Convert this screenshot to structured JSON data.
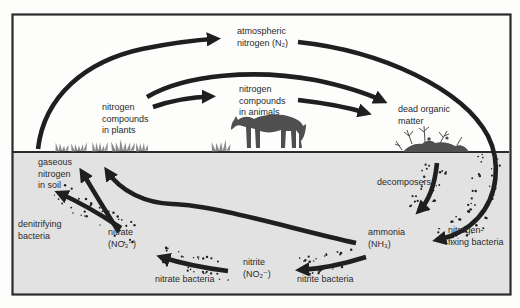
{
  "diagram": {
    "type": "cycle-diagram",
    "colors": {
      "background": "#fdfdfc",
      "soil": "#e2e2e2",
      "arrow": "#1f1f1f",
      "text": "#2a2a2a",
      "frame": "#2b2b2b",
      "silhouette": "#4f4f4f",
      "vegetation": "#8b8b8b"
    },
    "nodes": {
      "atmospheric_nitrogen": {
        "lines": [
          "atmospheric",
          "nitrogen (N₂)"
        ]
      },
      "nitrogen_compounds_in_plants": {
        "lines": [
          "nitrogen",
          "compounds",
          "in plants"
        ]
      },
      "nitrogen_compounds_in_animals": {
        "lines": [
          "nitrogen",
          "compounds",
          "in animals"
        ]
      },
      "dead_organic_matter": {
        "lines": [
          "dead organic",
          "matter"
        ]
      },
      "gaseous_nitrogen_in_soil": {
        "lines": [
          "gaseous",
          "nitrogen",
          "in soil"
        ]
      },
      "decomposers": {
        "lines": [
          "decomposers"
        ]
      },
      "denitrifying_bacteria": {
        "lines": [
          "denitrifying",
          "bacteria"
        ]
      },
      "nitrate": {
        "lines": [
          "nitrate",
          "(NO₃⁻)"
        ]
      },
      "nitrite": {
        "lines": [
          "nitrite",
          "(NO₂⁻)"
        ]
      },
      "ammonia": {
        "lines": [
          "ammonia",
          "(NH₃)"
        ]
      },
      "nitrate_bacteria": {
        "lines": [
          "nitrate bacteria"
        ]
      },
      "nitrite_bacteria": {
        "lines": [
          "nitrite bacteria"
        ]
      },
      "nitrogen_fixing_bacteria": {
        "lines": [
          "nitrogen-",
          "fixing bacteria"
        ]
      }
    },
    "flows": [
      {
        "from": "gaseous nitrogen in soil",
        "to": "atmospheric nitrogen (N₂)"
      },
      {
        "from": "atmospheric nitrogen (N₂)",
        "to": "ammonia (NH₃)",
        "via": "nitrogen-fixing bacteria"
      },
      {
        "from": "nitrogen compounds in plants",
        "to": "nitrogen compounds in animals"
      },
      {
        "from": "nitrogen compounds in plants",
        "to": "dead organic matter"
      },
      {
        "from": "nitrogen compounds in animals",
        "to": "dead organic matter"
      },
      {
        "from": "dead organic matter",
        "to": "ammonia (NH₃)",
        "via": "decomposers"
      },
      {
        "from": "ammonia (NH₃)",
        "to": "nitrite (NO₂⁻)",
        "via": "nitrite bacteria"
      },
      {
        "from": "nitrite (NO₂⁻)",
        "to": "nitrate (NO₃⁻)",
        "via": "nitrate bacteria"
      },
      {
        "from": "nitrate (NO₃⁻)",
        "to": "nitrogen compounds in plants"
      },
      {
        "from": "ammonia (NH₃)",
        "to": "nitrogen compounds in plants"
      },
      {
        "from": "nitrate (NO₃⁻)",
        "to": "gaseous nitrogen in soil",
        "via": "denitrifying bacteria"
      }
    ]
  }
}
